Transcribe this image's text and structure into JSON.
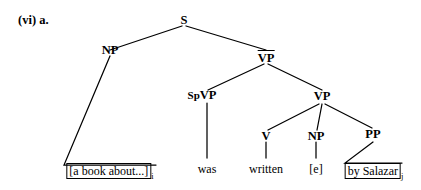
{
  "figure": {
    "example_label": "(vi) a.",
    "type": "syntactic-tree"
  },
  "nodes": {
    "s": {
      "label": "S",
      "bar": false
    },
    "np_subject": {
      "label": "NP",
      "bar": false
    },
    "vp_top": {
      "label": "VP",
      "bar": true
    },
    "vp_spec_marker": {
      "label": "Sp",
      "node_label": "VP",
      "bar": false
    },
    "vp_right": {
      "label": "VP",
      "bar": false
    },
    "v": {
      "label": "V",
      "bar": false
    },
    "np_trace": {
      "label": "NP",
      "bar": false
    },
    "pp": {
      "label": "PP",
      "bar": false
    }
  },
  "terminals": {
    "subject_phrase": {
      "text": "[a book about...]",
      "subscript": "i",
      "boxed": true
    },
    "aux": {
      "text": "was",
      "boxed": false
    },
    "participle": {
      "text": "written",
      "boxed": false
    },
    "empty_category": {
      "text": "[e]",
      "boxed": false
    },
    "agent_phrase": {
      "text": "by Salazar",
      "subscript": "j",
      "boxed": true
    }
  },
  "colors": {
    "ink": "#000000",
    "background": "#ffffff"
  }
}
